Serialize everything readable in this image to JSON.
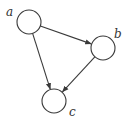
{
  "diagram": {
    "type": "directed-graph",
    "colors": {
      "stroke": "#3a3a3a",
      "fill": "#ffffff",
      "text": "#333333"
    },
    "nodes": [
      {
        "id": "a",
        "label": "a",
        "cx": 29,
        "cy": 22,
        "r": 12,
        "lx": 6,
        "ly": 16
      },
      {
        "id": "b",
        "label": "b",
        "cx": 103,
        "cy": 48,
        "r": 12,
        "lx": 114,
        "ly": 38
      },
      {
        "id": "c",
        "label": "c",
        "cx": 54,
        "cy": 101,
        "r": 12,
        "lx": 69,
        "ly": 116
      }
    ],
    "edges": [
      {
        "from": "a",
        "to": "b"
      },
      {
        "from": "a",
        "to": "c"
      },
      {
        "from": "b",
        "to": "c"
      }
    ]
  }
}
